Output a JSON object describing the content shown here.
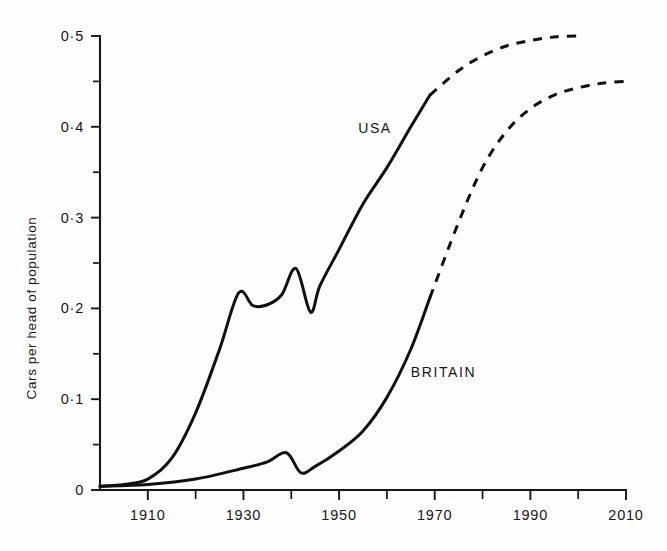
{
  "chart_data": {
    "type": "line",
    "title": "",
    "xlabel": "",
    "ylabel": "Cars per head of population",
    "xlim": [
      1900,
      2010
    ],
    "ylim": [
      0,
      0.5
    ],
    "grid": false,
    "legend_position": "inline-annotation",
    "x_ticks": [
      1900,
      1910,
      1920,
      1930,
      1940,
      1950,
      1960,
      1970,
      1980,
      1990,
      2000,
      2010
    ],
    "x_tick_labels": [
      "",
      "1910",
      "",
      "1930",
      "",
      "1950",
      "",
      "1970",
      "",
      "1990",
      "",
      "2010"
    ],
    "y_ticks": [
      0,
      0.05,
      0.1,
      0.15,
      0.2,
      0.25,
      0.3,
      0.35,
      0.4,
      0.45,
      0.5
    ],
    "y_tick_labels": [
      "0",
      "",
      "0·1",
      "",
      "0·2",
      "",
      "0·3",
      "",
      "0·4",
      "",
      "0·5"
    ],
    "series": [
      {
        "name": "USA",
        "label": "USA",
        "style_solid": "solid",
        "style_projected": "dashed",
        "projection_start_year": 1969,
        "points": [
          {
            "x": 1900,
            "y": 0.004
          },
          {
            "x": 1905,
            "y": 0.006
          },
          {
            "x": 1910,
            "y": 0.012
          },
          {
            "x": 1915,
            "y": 0.035
          },
          {
            "x": 1920,
            "y": 0.085
          },
          {
            "x": 1925,
            "y": 0.155
          },
          {
            "x": 1929,
            "y": 0.217
          },
          {
            "x": 1932,
            "y": 0.203
          },
          {
            "x": 1935,
            "y": 0.204
          },
          {
            "x": 1938,
            "y": 0.215
          },
          {
            "x": 1941,
            "y": 0.244
          },
          {
            "x": 1944,
            "y": 0.196
          },
          {
            "x": 1946,
            "y": 0.225
          },
          {
            "x": 1950,
            "y": 0.265
          },
          {
            "x": 1955,
            "y": 0.315
          },
          {
            "x": 1960,
            "y": 0.355
          },
          {
            "x": 1965,
            "y": 0.4
          },
          {
            "x": 1969,
            "y": 0.435
          },
          {
            "x": 1975,
            "y": 0.462
          },
          {
            "x": 1980,
            "y": 0.478
          },
          {
            "x": 1985,
            "y": 0.489
          },
          {
            "x": 1990,
            "y": 0.495
          },
          {
            "x": 1995,
            "y": 0.499
          },
          {
            "x": 2000,
            "y": 0.5
          }
        ]
      },
      {
        "name": "BRITAIN",
        "label": "BRITAIN",
        "style_solid": "solid",
        "style_projected": "dashed",
        "projection_start_year": 1969,
        "points": [
          {
            "x": 1900,
            "y": 0.004
          },
          {
            "x": 1910,
            "y": 0.006
          },
          {
            "x": 1920,
            "y": 0.012
          },
          {
            "x": 1930,
            "y": 0.024
          },
          {
            "x": 1935,
            "y": 0.031
          },
          {
            "x": 1939,
            "y": 0.041
          },
          {
            "x": 1942,
            "y": 0.019
          },
          {
            "x": 1945,
            "y": 0.026
          },
          {
            "x": 1950,
            "y": 0.043
          },
          {
            "x": 1955,
            "y": 0.065
          },
          {
            "x": 1960,
            "y": 0.102
          },
          {
            "x": 1965,
            "y": 0.155
          },
          {
            "x": 1969,
            "y": 0.212
          },
          {
            "x": 1975,
            "y": 0.295
          },
          {
            "x": 1980,
            "y": 0.355
          },
          {
            "x": 1985,
            "y": 0.395
          },
          {
            "x": 1990,
            "y": 0.42
          },
          {
            "x": 1995,
            "y": 0.435
          },
          {
            "x": 2000,
            "y": 0.443
          },
          {
            "x": 2005,
            "y": 0.448
          },
          {
            "x": 2010,
            "y": 0.45
          }
        ]
      }
    ],
    "annotations": [
      {
        "text": "USA",
        "x": 1954,
        "y": 0.393
      },
      {
        "text": "BRITAIN",
        "x": 1965,
        "y": 0.124
      }
    ]
  }
}
